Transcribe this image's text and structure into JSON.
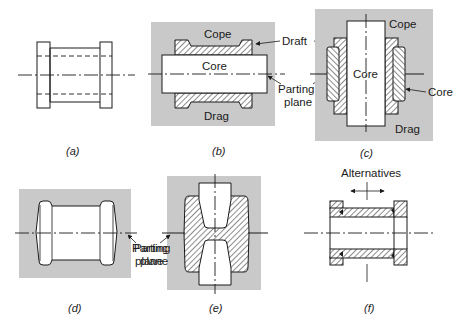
{
  "figure": {
    "mold_color": "#c9c9c9",
    "line_color": "#1a1a1a",
    "panels": [
      {
        "id": "a",
        "caption": "(a)",
        "description": "Part drawing with hidden bore lines"
      },
      {
        "id": "b",
        "caption": "(b)",
        "labels": {
          "top": "Cope",
          "center": "Core",
          "bottom": "Drag"
        }
      },
      {
        "id": "c",
        "caption": "(c)",
        "labels": {
          "top": "Cope",
          "center": "Core",
          "bottom": "Drag",
          "side": "Core"
        }
      },
      {
        "id": "d",
        "caption": "(d)"
      },
      {
        "id": "e",
        "caption": "(e)"
      },
      {
        "id": "f",
        "caption": "(f)",
        "labels": {
          "top": "Alternatives"
        }
      }
    ],
    "callouts": {
      "draft": "Draft",
      "parting_plane_line1": "Parting",
      "parting_plane_line2": "plane",
      "core": "Core",
      "alternatives": "Alternatives"
    }
  }
}
